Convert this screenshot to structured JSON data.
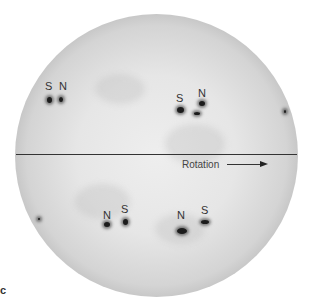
{
  "figure": {
    "panel_label": "c",
    "equator_label": "Rotation",
    "sunspot_groups": [
      {
        "position": "upper-left",
        "labels": [
          "S",
          "N"
        ]
      },
      {
        "position": "upper-right",
        "labels": [
          "S",
          "N"
        ]
      },
      {
        "position": "lower-left",
        "labels": [
          "N",
          "S"
        ]
      },
      {
        "position": "lower-right",
        "labels": [
          "N",
          "S"
        ]
      }
    ]
  }
}
